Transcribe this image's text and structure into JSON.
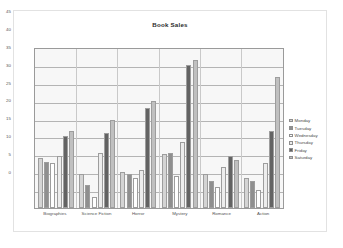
{
  "chart_data": {
    "type": "bar",
    "title": "Book Sales",
    "xlabel": "",
    "ylabel": "",
    "ylim": [
      0,
      45
    ],
    "ytick_step": 5,
    "yticks": [
      0,
      5,
      10,
      15,
      20,
      25,
      30,
      35,
      40,
      45
    ],
    "grid": true,
    "legend_position": "right",
    "categories": [
      "Biographies",
      "Science Fiction",
      "Horror",
      "Mystery",
      "Romance",
      "Action"
    ],
    "series": [
      {
        "name": "Monday",
        "color": "#d4d4d4",
        "values": [
          14.0,
          9.5,
          10.0,
          15.0,
          9.5,
          8.5
        ]
      },
      {
        "name": "Tuesday",
        "color": "#8f8f8f",
        "values": [
          13.0,
          6.5,
          9.5,
          15.5,
          7.5,
          7.5
        ]
      },
      {
        "name": "Wednesday",
        "color": "#ffffff",
        "values": [
          12.5,
          3.0,
          8.5,
          9.0,
          6.0,
          5.0
        ]
      },
      {
        "name": "Thursday",
        "color": "#ededed",
        "values": [
          14.5,
          15.5,
          10.5,
          18.5,
          11.5,
          12.5
        ]
      },
      {
        "name": "Friday",
        "color": "#636363",
        "values": [
          20.0,
          21.0,
          28.0,
          40.0,
          14.5,
          21.5
        ]
      },
      {
        "name": "Saturday",
        "color": "#c0c0c0",
        "values": [
          21.5,
          24.5,
          30.0,
          41.5,
          13.5,
          36.5
        ]
      }
    ]
  },
  "legend": {
    "items": [
      {
        "label": "Monday"
      },
      {
        "label": "Tuesday"
      },
      {
        "label": "Wednesday"
      },
      {
        "label": "Thursday"
      },
      {
        "label": "Friday"
      },
      {
        "label": "Saturday"
      }
    ]
  }
}
